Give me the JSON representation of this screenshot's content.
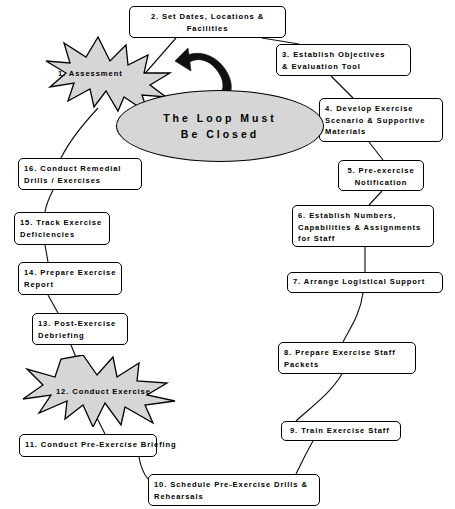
{
  "diagram": {
    "title": "The Loop Must Be Closed",
    "center_label": "The Loop Must\nBe Closed",
    "colors": {
      "shape_fill": "#d6d6d6",
      "outline": "#000000",
      "box_fill": "#ffffff",
      "arrow": "#111111",
      "background": "#ffffff"
    },
    "nodes": [
      {
        "id": "n1",
        "number": "1.",
        "label": "1. Assessment",
        "shape": "star",
        "x": 44,
        "y": 35,
        "w": 132,
        "h": 78
      },
      {
        "id": "n2",
        "number": "2.",
        "label": "2. Set Dates, Locations &\nFacilities",
        "shape": "box",
        "x": 129,
        "y": 6,
        "w": 157,
        "h": 32
      },
      {
        "id": "n3",
        "number": "3.",
        "label": "3. Establish Objectives\n& Evaluation Tool",
        "shape": "box",
        "x": 276,
        "y": 44,
        "w": 135,
        "h": 32
      },
      {
        "id": "n4",
        "number": "4.",
        "label": "4. Develop Exercise\nScenario & Supportive\nMaterials",
        "shape": "box",
        "x": 319,
        "y": 98,
        "w": 124,
        "h": 44
      },
      {
        "id": "n5",
        "number": "5.",
        "label": "5. Pre-exercise\nNotification",
        "shape": "box",
        "x": 338,
        "y": 160,
        "w": 86,
        "h": 31
      },
      {
        "id": "n6",
        "number": "6.",
        "label": "6. Establish Numbers,\nCapabilities & Assignments\nfor Staff",
        "shape": "box",
        "x": 292,
        "y": 205,
        "w": 142,
        "h": 42
      },
      {
        "id": "n7",
        "number": "7.",
        "label": "7. Arrange Logistical Support",
        "shape": "box",
        "x": 287,
        "y": 272,
        "w": 156,
        "h": 21
      },
      {
        "id": "n8",
        "number": "8.",
        "label": "8. Prepare Exercise Staff\nPackets",
        "shape": "box",
        "x": 278,
        "y": 342,
        "w": 138,
        "h": 32
      },
      {
        "id": "n9",
        "number": "9.",
        "label": "9. Train Exercise Staff",
        "shape": "box",
        "x": 281,
        "y": 421,
        "w": 120,
        "h": 20
      },
      {
        "id": "n10",
        "number": "10.",
        "label": "10. Schedule Pre-Exercise Drills &\nRehearsals",
        "shape": "box",
        "x": 148,
        "y": 474,
        "w": 172,
        "h": 32
      },
      {
        "id": "n11",
        "number": "11.",
        "label": "11. Conduct Pre-Exercise Briefing",
        "shape": "box",
        "x": 19,
        "y": 434,
        "w": 138,
        "h": 23,
        "text_overflows": true
      },
      {
        "id": "n12",
        "number": "12.",
        "label": "12. Conduct Exercise",
        "shape": "star",
        "x": 21,
        "y": 355,
        "w": 156,
        "h": 72
      },
      {
        "id": "n13",
        "number": "13.",
        "label": "13. Post-Exercise\nDebriefing",
        "shape": "box",
        "x": 32,
        "y": 313,
        "w": 96,
        "h": 32
      },
      {
        "id": "n14",
        "number": "14.",
        "label": "14. Prepare Exercise\nReport",
        "shape": "box",
        "x": 18,
        "y": 262,
        "w": 104,
        "h": 33
      },
      {
        "id": "n15",
        "number": "15.",
        "label": "15. Track Exercise\nDeficiencies",
        "shape": "box",
        "x": 14,
        "y": 212,
        "w": 96,
        "h": 33
      },
      {
        "id": "n16",
        "number": "16.",
        "label": "16. Conduct Remedial\nDrills / Exercises",
        "shape": "box",
        "x": 18,
        "y": 158,
        "w": 124,
        "h": 32
      }
    ],
    "connections": [
      {
        "from": "n1",
        "to": "n2"
      },
      {
        "from": "n2",
        "to": "n3"
      },
      {
        "from": "n3",
        "to": "n4"
      },
      {
        "from": "n4",
        "to": "n5"
      },
      {
        "from": "n5",
        "to": "n6"
      },
      {
        "from": "n6",
        "to": "n7"
      },
      {
        "from": "n7",
        "to": "n8"
      },
      {
        "from": "n8",
        "to": "n9"
      },
      {
        "from": "n9",
        "to": "n10"
      },
      {
        "from": "n10",
        "to": "n11"
      },
      {
        "from": "n11",
        "to": "n12"
      },
      {
        "from": "n12",
        "to": "n13"
      },
      {
        "from": "n13",
        "to": "n14"
      },
      {
        "from": "n14",
        "to": "n15"
      },
      {
        "from": "n15",
        "to": "n16"
      },
      {
        "from": "n16",
        "to": "n1"
      }
    ]
  }
}
